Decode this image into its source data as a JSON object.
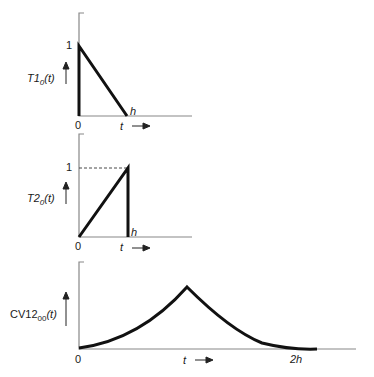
{
  "panels": [
    {
      "name": "T1_0",
      "ylabel_main": "T1",
      "ylabel_sub": "0",
      "ylabel_arg": "(t)",
      "y_tick": "1",
      "x_origin": "0",
      "x_label": "t",
      "x_end_label": "h",
      "shape": "falling ramp from 1 at t=0 to 0 at t=h"
    },
    {
      "name": "T2_0",
      "ylabel_main": "T2",
      "ylabel_sub": "0",
      "ylabel_arg": "(t)",
      "y_tick": "1",
      "x_origin": "0",
      "x_label": "t",
      "x_end_label": "h",
      "shape": "rising ramp from 0 at t=0 to 1 at t=h, then drop to 0"
    },
    {
      "name": "CV12_00",
      "ylabel_main": "CV12",
      "ylabel_sub": "00",
      "ylabel_arg": "(t)",
      "x_origin": "0",
      "x_label": "t",
      "x_end_label": "2h",
      "shape": "convex rise from 0 to peak at t=h, convex decay to 0 at t=2h"
    }
  ],
  "arrow": "→"
}
